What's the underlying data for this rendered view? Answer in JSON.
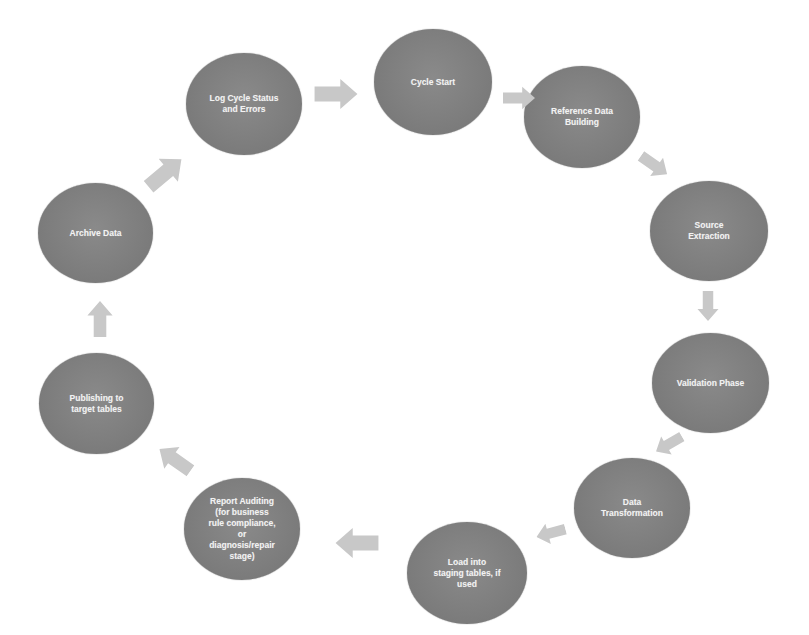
{
  "diagram": {
    "type": "cycle",
    "node_color": "#7f7f7f",
    "arrow_color": "#c8c8c8",
    "text_color": "#f2f2f2",
    "nodes": [
      {
        "id": "cycle-start",
        "label": "Cycle Start"
      },
      {
        "id": "reference-data-building",
        "label": "Reference Data\nBuilding"
      },
      {
        "id": "source-extraction",
        "label": "Source\nExtraction"
      },
      {
        "id": "validation-phase",
        "label": "Validation Phase"
      },
      {
        "id": "data-transformation",
        "label": "Data\nTransformation"
      },
      {
        "id": "load-into-staging",
        "label": "Load  into\nstaging tables, if\nused"
      },
      {
        "id": "report-auditing",
        "label": "Report Auditing\n(for business\nrule compliance,\nor\ndiagnosis/repair\nstage)"
      },
      {
        "id": "publishing",
        "label": "Publishing to\ntarget tables"
      },
      {
        "id": "archive-data",
        "label": "Archive Data"
      },
      {
        "id": "log-cycle-status",
        "label": "Log Cycle Status\nand Errors"
      }
    ],
    "edges": [
      {
        "from": "cycle-start",
        "to": "reference-data-building"
      },
      {
        "from": "reference-data-building",
        "to": "source-extraction"
      },
      {
        "from": "source-extraction",
        "to": "validation-phase"
      },
      {
        "from": "validation-phase",
        "to": "data-transformation"
      },
      {
        "from": "data-transformation",
        "to": "load-into-staging"
      },
      {
        "from": "load-into-staging",
        "to": "report-auditing"
      },
      {
        "from": "report-auditing",
        "to": "publishing"
      },
      {
        "from": "publishing",
        "to": "archive-data"
      },
      {
        "from": "archive-data",
        "to": "log-cycle-status"
      },
      {
        "from": "log-cycle-status",
        "to": "cycle-start"
      }
    ]
  }
}
